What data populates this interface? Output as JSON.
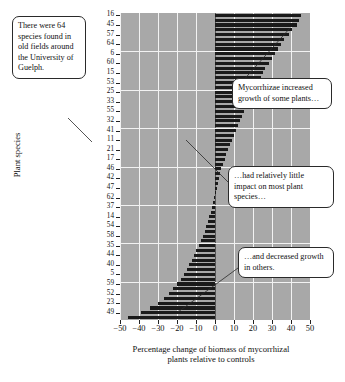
{
  "figure": {
    "yaxis_title": "Plant species",
    "xaxis_title_line1": "Percentage change of biomass of mycorrhizal",
    "xaxis_title_line2": "plants relative to controls"
  },
  "callouts": {
    "species_count": "There were 64 species found in old fields around the University of Guelph.",
    "increased": "Mycorrhizae increased growth of some plants…",
    "little_impact": "…had relatively little impact on most plant species…",
    "decreased": "…and decreased growth in others."
  },
  "colors": {
    "plot_background": "#a8a8a8",
    "gridline": "#f2f2f2",
    "bar": "#1a1a1a",
    "axis": "#222222",
    "callout_border": "#2a2a2a",
    "page_background": "#ffffff"
  },
  "chart_data": {
    "type": "bar",
    "orientation": "horizontal",
    "title": "",
    "xlabel": "Percentage change of biomass of mycorrhizal plants relative to controls",
    "ylabel": "Plant species",
    "xlim": [
      -50,
      50
    ],
    "xticks": [
      -50,
      -40,
      -30,
      -20,
      -10,
      0,
      10,
      20,
      30,
      40,
      50
    ],
    "xtick_labels": [
      "-50",
      "-40",
      "-30",
      "-20",
      "-10",
      "0",
      "10",
      "20",
      "30",
      "40",
      "50"
    ],
    "grid": true,
    "legend": "none",
    "n_species": 64,
    "ytick_labels": [
      "16",
      "45",
      "57",
      "64",
      "6",
      "60",
      "15",
      "53",
      "25",
      "33",
      "55",
      "32",
      "41",
      "11",
      "21",
      "17",
      "46",
      "42",
      "47",
      "62",
      "37",
      "14",
      "54",
      "58",
      "35",
      "44",
      "40",
      "5",
      "59",
      "52",
      "23",
      "49"
    ],
    "ytick_interval": 2,
    "categories": [
      "16",
      "34",
      "45",
      "51",
      "57",
      "7",
      "64",
      "63",
      "6",
      "13",
      "60",
      "28",
      "15",
      "19",
      "53",
      "8",
      "25",
      "2",
      "33",
      "30",
      "55",
      "9",
      "32",
      "26",
      "41",
      "48",
      "11",
      "39",
      "21",
      "3",
      "17",
      "50",
      "46",
      "20",
      "42",
      "61",
      "47",
      "12",
      "62",
      "29",
      "37",
      "4",
      "14",
      "56",
      "54",
      "18",
      "58",
      "27",
      "35",
      "10",
      "44",
      "1",
      "40",
      "31",
      "5",
      "36",
      "59",
      "22",
      "52",
      "43",
      "23",
      "38",
      "49",
      "24"
    ],
    "values": [
      45.0,
      44.0,
      43.0,
      40.5,
      39.0,
      36.5,
      34.5,
      33.0,
      31.5,
      30.0,
      28.5,
      26.5,
      25.0,
      24.0,
      22.5,
      21.0,
      19.5,
      18.0,
      17.0,
      16.0,
      15.0,
      14.0,
      13.0,
      12.0,
      11.0,
      10.0,
      9.0,
      8.0,
      7.0,
      6.0,
      5.0,
      4.0,
      3.0,
      2.5,
      2.0,
      1.5,
      1.0,
      0.5,
      -0.5,
      -1.0,
      -1.5,
      -2.0,
      -3.0,
      -3.5,
      -4.5,
      -5.5,
      -6.5,
      -7.5,
      -8.5,
      -10.0,
      -11.0,
      -12.0,
      -13.5,
      -15.0,
      -16.5,
      -18.0,
      -20.0,
      -22.0,
      -24.0,
      -27.0,
      -30.0,
      -34.0,
      -39.0,
      -46.0
    ]
  }
}
